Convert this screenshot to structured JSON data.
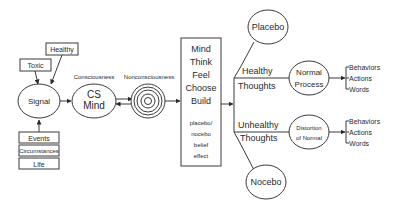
{
  "diagram": {
    "inputs_top": {
      "toxic": "Toxic",
      "healthy": "Healthy"
    },
    "signal": "Signal",
    "inputs_bottom": [
      "Events",
      "Circumstances",
      "Life"
    ],
    "consciousness_label": "Consciousness",
    "cs_mind": [
      "CS",
      "Mind"
    ],
    "nonconsciousness_label": "Nonconsciousness",
    "mind_box": {
      "main": [
        "Mind",
        "Think",
        "Feel",
        "Choose",
        "Build"
      ],
      "sub": [
        "placebo/",
        "nocebo",
        "belief",
        "effect"
      ]
    },
    "placebo": "Placebo",
    "nocebo": "Nocebo",
    "healthy_thoughts": [
      "Healthy",
      "Thoughts"
    ],
    "unhealthy_thoughts": [
      "Unhealthy",
      "Thoughts"
    ],
    "normal_process": [
      "Normal",
      "Process"
    ],
    "distortion": [
      "Distortion",
      "of Normal"
    ],
    "outputs_top": [
      "Behaviors",
      "Actions",
      "Words"
    ],
    "outputs_bottom": [
      "Behaviors",
      "Actions",
      "Words"
    ]
  }
}
